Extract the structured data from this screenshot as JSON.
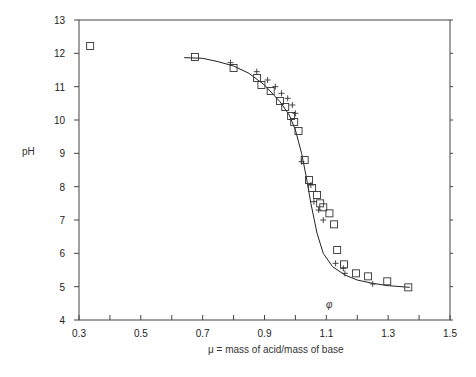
{
  "chart_data": {
    "type": "scatter",
    "title": "",
    "xlabel": "μ = mass of acid/mass of base",
    "ylabel": "pH",
    "annotation": "φ",
    "xlim": [
      0.3,
      1.5
    ],
    "ylim": [
      4,
      13
    ],
    "x_ticks": [
      "0.3",
      "0.5",
      "0.7",
      "0.9",
      "1.1",
      "1.3",
      "1.5"
    ],
    "y_ticks": [
      "4",
      "5",
      "6",
      "7",
      "8",
      "9",
      "10",
      "11",
      "12",
      "13"
    ],
    "grid": false,
    "legend": null,
    "series": [
      {
        "name": "squares",
        "marker": "square",
        "points": [
          [
            0.336,
            12.22
          ],
          [
            0.675,
            11.89
          ],
          [
            0.8,
            11.56
          ],
          [
            0.876,
            11.26
          ],
          [
            0.89,
            11.05
          ],
          [
            0.92,
            10.87
          ],
          [
            0.95,
            10.57
          ],
          [
            0.967,
            10.39
          ],
          [
            0.986,
            10.12
          ],
          [
            0.996,
            9.94
          ],
          [
            1.01,
            9.67
          ],
          [
            1.03,
            8.8
          ],
          [
            1.044,
            8.2
          ],
          [
            1.054,
            7.96
          ],
          [
            1.07,
            7.75
          ],
          [
            1.08,
            7.5
          ],
          [
            1.09,
            7.38
          ],
          [
            1.11,
            7.2
          ],
          [
            1.125,
            6.87
          ],
          [
            1.135,
            6.1
          ],
          [
            1.157,
            5.67
          ],
          [
            1.196,
            5.4
          ],
          [
            1.235,
            5.31
          ],
          [
            1.297,
            5.16
          ],
          [
            1.365,
            4.98
          ]
        ]
      },
      {
        "name": "crosses",
        "marker": "plus",
        "points": [
          [
            0.79,
            11.72
          ],
          [
            0.875,
            11.45
          ],
          [
            0.91,
            11.2
          ],
          [
            0.935,
            11.0
          ],
          [
            0.955,
            10.8
          ],
          [
            0.975,
            10.65
          ],
          [
            0.99,
            10.45
          ],
          [
            1.0,
            10.2
          ],
          [
            1.02,
            8.75
          ],
          [
            1.05,
            8.05
          ],
          [
            1.06,
            7.55
          ],
          [
            1.075,
            7.3
          ],
          [
            1.09,
            7.0
          ],
          [
            1.13,
            5.7
          ],
          [
            1.155,
            5.55
          ],
          [
            1.16,
            5.4
          ],
          [
            1.25,
            5.08
          ]
        ]
      },
      {
        "name": "fit-curve",
        "marker": "line",
        "points": [
          [
            0.64,
            11.87
          ],
          [
            0.7,
            11.85
          ],
          [
            0.75,
            11.75
          ],
          [
            0.8,
            11.62
          ],
          [
            0.85,
            11.4
          ],
          [
            0.9,
            11.05
          ],
          [
            0.95,
            10.55
          ],
          [
            0.98,
            10.15
          ],
          [
            1.0,
            9.7
          ],
          [
            1.02,
            9.0
          ],
          [
            1.035,
            8.3
          ],
          [
            1.05,
            7.5
          ],
          [
            1.07,
            6.6
          ],
          [
            1.09,
            6.0
          ],
          [
            1.12,
            5.6
          ],
          [
            1.16,
            5.35
          ],
          [
            1.2,
            5.2
          ],
          [
            1.25,
            5.1
          ],
          [
            1.3,
            5.03
          ],
          [
            1.37,
            4.98
          ]
        ]
      }
    ]
  }
}
